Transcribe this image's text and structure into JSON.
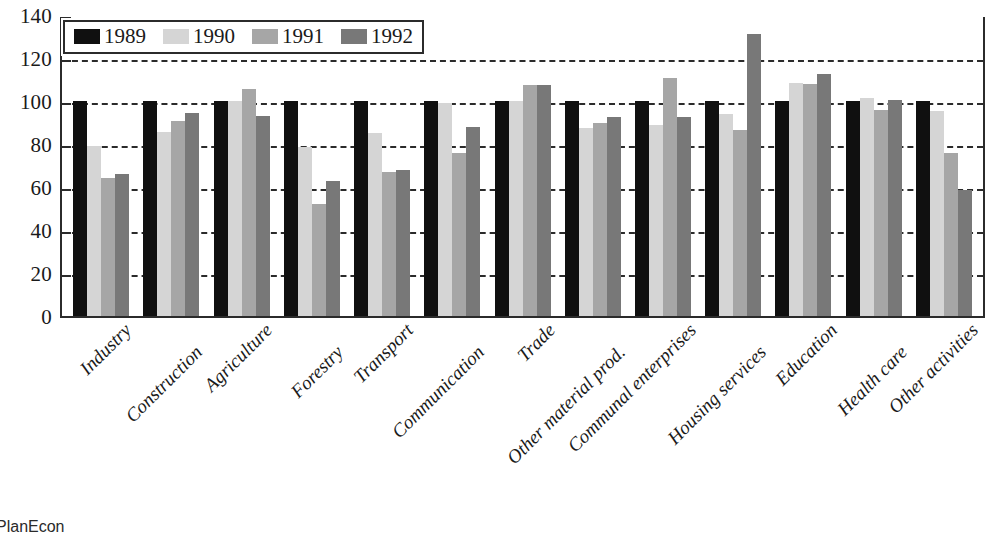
{
  "source_note": "PlanEcon",
  "chart_data": {
    "type": "bar",
    "title": "",
    "subtitle": "",
    "xlabel": "",
    "ylabel": "",
    "ylim": [
      0,
      140
    ],
    "ytick_step": 20,
    "yticks": [
      140,
      120,
      100,
      80,
      60,
      40,
      20,
      0
    ],
    "ytick_labels": [
      "140",
      "120",
      "100",
      "80",
      "60",
      "40",
      "20",
      "0"
    ],
    "grid": true,
    "grid_style": "dashed horizontal",
    "legend_position": "top-left inside plot",
    "categories": [
      "Industry",
      "Construction",
      "Agriculture",
      "Forestry",
      "Transport",
      "Communication",
      "Trade",
      "Other material prod.",
      "Communal enterprises",
      "Housing services",
      "Education",
      "Health care",
      "Other activities"
    ],
    "series": [
      {
        "name": "1989",
        "color": "#101010",
        "values": [
          100,
          100,
          100,
          100,
          100,
          100,
          100,
          100,
          100,
          100,
          100,
          100,
          100
        ]
      },
      {
        "name": "1990",
        "color": "#d5d5d5",
        "values": [
          79,
          85.5,
          100,
          78.5,
          85,
          99,
          100,
          87.5,
          89,
          94,
          108.5,
          101.5,
          95.5
        ]
      },
      {
        "name": "1991",
        "color": "#a6a6a6",
        "values": [
          64,
          90.5,
          105.5,
          52,
          67,
          76,
          107.5,
          90,
          110.5,
          86.5,
          108,
          96,
          76
        ]
      },
      {
        "name": "1992",
        "color": "#787878",
        "values": [
          66,
          94.5,
          93,
          63,
          68,
          88,
          107.5,
          92.5,
          92.5,
          131,
          112.5,
          100.5,
          58.5
        ]
      }
    ]
  }
}
